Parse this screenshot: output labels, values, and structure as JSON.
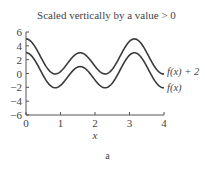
{
  "chart_data": {
    "type": "line",
    "title": "Scaled vertically by a value > 0",
    "xlabel": "x",
    "ylabel": "",
    "caption": "a",
    "xlim": [
      0,
      4
    ],
    "ylim": [
      -6,
      6
    ],
    "xticks": [
      0,
      1,
      2,
      3,
      4
    ],
    "yticks": [
      6,
      4,
      2,
      0,
      -2,
      -4,
      -6
    ],
    "grid": false,
    "legend_position": "inline-right",
    "series": [
      {
        "name": "f(x) + 2",
        "x": [
          0,
          0.4,
          0.8,
          1.2,
          1.6,
          2.0,
          2.4,
          2.8,
          3.15,
          3.6,
          4.0
        ],
        "values": [
          5.0,
          2.6,
          0.0,
          1.1,
          3.0,
          1.0,
          0.1,
          2.8,
          5.0,
          2.3,
          0.0
        ]
      },
      {
        "name": "f(x)",
        "x": [
          0,
          0.4,
          0.8,
          1.2,
          1.6,
          2.0,
          2.4,
          2.8,
          3.15,
          3.6,
          4.0
        ],
        "values": [
          3.0,
          0.6,
          -2.0,
          -0.9,
          1.0,
          -1.0,
          -1.9,
          0.8,
          3.0,
          0.3,
          -2.0
        ]
      }
    ]
  }
}
